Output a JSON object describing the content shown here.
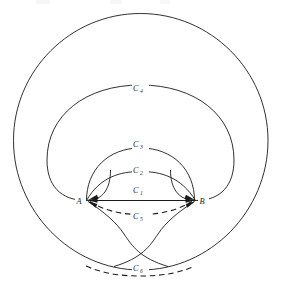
{
  "figure": {
    "background_color": "#ffffff",
    "stroke_color": "#1a1a1a",
    "label_color": "#2b2b2b",
    "width": 281,
    "height": 283
  },
  "points": [
    {
      "id": "A",
      "label": "A",
      "x": 86,
      "y": 200,
      "label_x": 78,
      "label_y": 202
    },
    {
      "id": "B",
      "label": "B",
      "x": 196,
      "y": 200,
      "label_x": 201,
      "label_y": 202
    }
  ],
  "curve_labels": [
    {
      "id": "C1",
      "base": "C",
      "sub": "1",
      "x": 141,
      "y": 192,
      "style": "solid",
      "note": "straight chord from A to B"
    },
    {
      "id": "C2",
      "base": "C",
      "sub": "2",
      "x": 141,
      "y": 172,
      "style": "solid",
      "note": "small arc above chord"
    },
    {
      "id": "C3",
      "base": "C",
      "sub": "3",
      "x": 141,
      "y": 146,
      "style": "solid",
      "note": "medium hook arc"
    },
    {
      "id": "C4",
      "base": "C",
      "sub": "4",
      "x": 141,
      "y": 90,
      "style": "solid",
      "note": "large hook arc"
    },
    {
      "id": "C5",
      "base": "C",
      "sub": "5",
      "x": 141,
      "y": 218,
      "style": "dashed",
      "note": "dashed arc below chord"
    },
    {
      "id": "C6",
      "base": "C",
      "sub": "6",
      "x": 141,
      "y": 270,
      "style": "dashed",
      "note": "dashed arc at bottom"
    }
  ],
  "legend_note": {
    "solid_label": "solid curve",
    "dashed_label": "dashed curve"
  }
}
